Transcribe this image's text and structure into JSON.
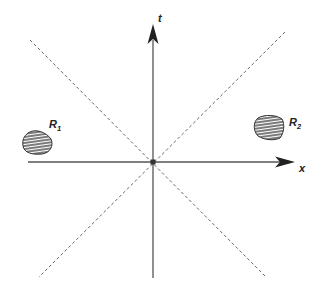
{
  "diagram": {
    "type": "spacetime-diagram",
    "axes": {
      "vertical": {
        "label": "t"
      },
      "horizontal": {
        "label": "x"
      }
    },
    "light_cone": {
      "style": "dashed",
      "lines": 2
    },
    "regions": [
      {
        "id": "R1",
        "label": "R",
        "subscript": "1",
        "side": "left",
        "fill": "hatched"
      },
      {
        "id": "R2",
        "label": "R",
        "subscript": "2",
        "side": "right",
        "fill": "hatched"
      }
    ],
    "colors": {
      "line": "#555555",
      "ink": "#222222",
      "background": "#ffffff"
    }
  }
}
